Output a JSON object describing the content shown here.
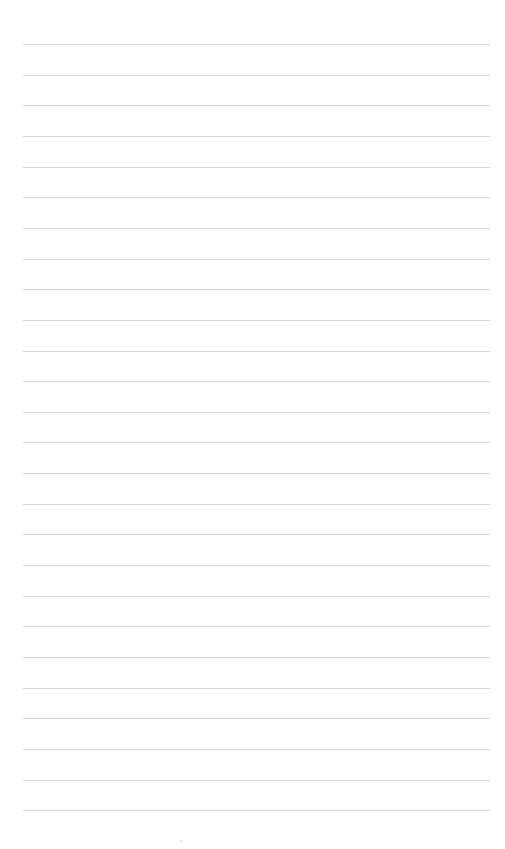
{
  "page": {
    "type": "lined-paper",
    "background_color": "#ffffff",
    "rule_color": "#d6d6d6",
    "rule_count": 26,
    "first_rule_y": 44,
    "rule_spacing": 30.65,
    "rule_left": 23,
    "rule_right": 490
  }
}
